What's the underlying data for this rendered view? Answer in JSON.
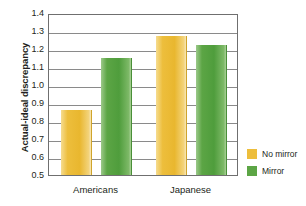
{
  "chart_data": {
    "type": "bar",
    "title": "",
    "xlabel": "",
    "ylabel": "Actual-ideal discrepancy",
    "categories": [
      "Americans",
      "Japanese"
    ],
    "ylim": [
      0.5,
      1.4
    ],
    "yticks": [
      "1.4",
      "1.3",
      "1.2",
      "1.1",
      "1.0",
      "0.9",
      "0.8",
      "0.7",
      "0.6",
      "0.5"
    ],
    "ytick_values": [
      1.4,
      1.3,
      1.2,
      1.1,
      1.0,
      0.9,
      0.8,
      0.7,
      0.6,
      0.5
    ],
    "grid": true,
    "legend_position": "right",
    "series": [
      {
        "name": "No mirror",
        "color": "#edbe3c",
        "values": [
          0.86,
          1.27
        ]
      },
      {
        "name": "Mirror",
        "color": "#5ca545",
        "values": [
          1.15,
          1.22
        ]
      }
    ]
  },
  "legend": {
    "items": [
      {
        "label": "No mirror",
        "color": "#edbe3c"
      },
      {
        "label": "Mirror",
        "color": "#5ca545"
      }
    ]
  },
  "axes": {
    "y_title": "Actual-ideal discrepancy"
  }
}
